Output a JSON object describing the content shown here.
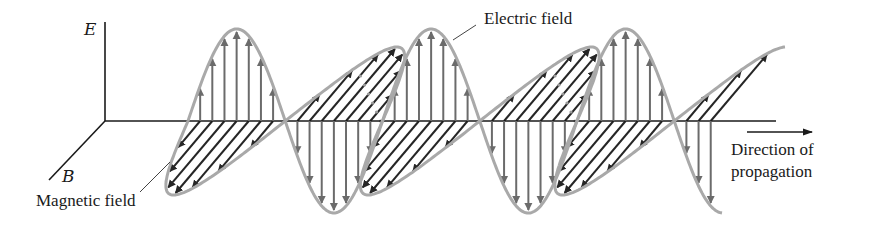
{
  "figure": {
    "axes": {
      "e_axis_label": "E",
      "b_axis_label": "B"
    },
    "labels": {
      "electric_field": "Electric field",
      "magnetic_field": "Magnetic field",
      "direction_line1": "Direction of",
      "direction_line2": "propagation"
    },
    "wave": {
      "cycles_shown": 2.75,
      "e_and_b_in_phase": true,
      "arrows_per_half_cycle": 7
    },
    "colors": {
      "axes": "#1a1a1a",
      "wave_outline": "#a9a9a9",
      "electric_arrows": "#6b6b6b",
      "magnetic_arrows": "#262626",
      "hidden_outline": "#9a9a9a"
    }
  }
}
